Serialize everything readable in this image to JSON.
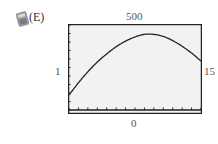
{
  "choice_label": "(E)",
  "icon": "calculator-icon",
  "window": {
    "xmin_label": "1",
    "xmax_label": "15",
    "ymin_label": "0",
    "ymax_label": "500"
  },
  "colors": {
    "frame": "#222222",
    "background": "#f2f2f2",
    "curve": "#222222"
  },
  "chart_data": {
    "type": "line",
    "title": "",
    "xlabel": "",
    "ylabel": "",
    "xlim": [
      1,
      15
    ],
    "ylim": [
      0,
      500
    ],
    "x_tick_count": 14,
    "grid": false,
    "legend": "none",
    "annotations": [
      "(E)",
      "1",
      "15",
      "0",
      "500"
    ],
    "series": [
      {
        "name": "curve",
        "x": [
          1,
          2,
          3,
          4,
          5,
          6,
          7,
          8,
          9,
          10,
          11,
          12,
          13,
          14,
          15
        ],
        "values": [
          88,
          160,
          225,
          282,
          330,
          372,
          405,
          430,
          445,
          445,
          433,
          408,
          375,
          335,
          288
        ]
      }
    ]
  }
}
